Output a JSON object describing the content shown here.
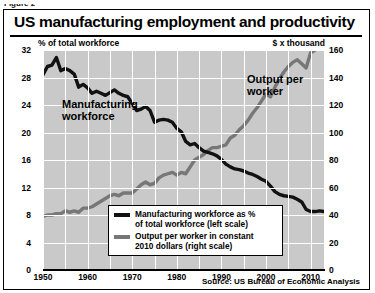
{
  "figure_label": "Figure 2",
  "title": "US manufacturing employment and productivity",
  "axis_note_left": "% of total workforce",
  "axis_note_right": "$ x thousand",
  "source": "Source: US Bureau of Economic Analysis",
  "labels": {
    "manufacturing": "Manufacturing\nworkforce",
    "output": "Output per\nworker"
  },
  "legend": {
    "items": [
      {
        "text": "Manufacturing workforce as %\nof total workforce (left scale)",
        "color": "#111111"
      },
      {
        "text": "Output per worker in constant\n2010 dollars (right scale)",
        "color": "#777777"
      }
    ]
  },
  "colors": {
    "plot_background": "#c9c9c9",
    "gridline": "#ffffff",
    "manufacturing_line": "#111111",
    "output_line": "#777777",
    "frame": "#000000"
  },
  "chart_data": {
    "type": "line",
    "title": "US manufacturing employment and productivity",
    "subtitle": "",
    "xlabel": "",
    "ylabel": "% of total workforce",
    "y2label": "$ x thousand",
    "xlim": [
      1950,
      2013
    ],
    "ylim": [
      0,
      32
    ],
    "y2lim": [
      0,
      160
    ],
    "yticks": [
      0,
      4,
      8,
      12,
      16,
      20,
      24,
      28,
      32
    ],
    "y2ticks": [
      0,
      20,
      40,
      60,
      80,
      100,
      120,
      140,
      160
    ],
    "xticks": [
      1950,
      1960,
      1970,
      1980,
      1990,
      2000,
      2010
    ],
    "grid": true,
    "grid_x_step": 5,
    "legend_position": "inside-bottom-center",
    "annotations": [
      {
        "text": "Manufacturing workforce",
        "x": 1957,
        "y": 22
      },
      {
        "text": "Output per worker",
        "x": 2000,
        "y": 28
      }
    ],
    "series": [
      {
        "name": "Manufacturing workforce as % of total workforce (left scale)",
        "axis": "left",
        "units": "% of total workforce",
        "color": "#111111",
        "x": [
          1950,
          1951,
          1952,
          1953,
          1954,
          1955,
          1956,
          1957,
          1958,
          1959,
          1960,
          1961,
          1962,
          1963,
          1964,
          1965,
          1966,
          1967,
          1968,
          1969,
          1970,
          1971,
          1972,
          1973,
          1974,
          1975,
          1976,
          1977,
          1978,
          1979,
          1980,
          1981,
          1982,
          1983,
          1984,
          1985,
          1986,
          1987,
          1988,
          1989,
          1990,
          1991,
          1992,
          1993,
          1994,
          1995,
          1996,
          1997,
          1998,
          1999,
          2000,
          2001,
          2002,
          2003,
          2004,
          2005,
          2006,
          2007,
          2008,
          2009,
          2010,
          2011,
          2012,
          2013
        ],
        "y": [
          28.4,
          29.6,
          29.8,
          30.9,
          29.0,
          29.3,
          29.0,
          28.5,
          26.6,
          27.0,
          26.5,
          25.7,
          26.0,
          25.7,
          25.4,
          25.8,
          26.2,
          25.7,
          25.4,
          25.2,
          24.2,
          23.2,
          23.4,
          23.8,
          23.2,
          21.5,
          21.8,
          21.9,
          21.8,
          21.5,
          20.6,
          20.1,
          18.7,
          18.2,
          18.4,
          17.8,
          17.3,
          17.1,
          16.9,
          16.6,
          16.1,
          15.4,
          15.0,
          14.7,
          14.6,
          14.4,
          14.1,
          13.9,
          13.6,
          13.2,
          12.9,
          12.2,
          11.4,
          11.0,
          10.8,
          10.7,
          10.6,
          10.3,
          9.9,
          8.8,
          8.5,
          8.5,
          8.6,
          8.5
        ]
      },
      {
        "name": "Output per worker in constant 2010 dollars (right scale)",
        "axis": "right",
        "units": "$ x thousand",
        "color": "#777777",
        "x": [
          1950,
          1951,
          1952,
          1953,
          1954,
          1955,
          1956,
          1957,
          1958,
          1959,
          1960,
          1961,
          1962,
          1963,
          1964,
          1965,
          1966,
          1967,
          1968,
          1969,
          1970,
          1971,
          1972,
          1973,
          1974,
          1975,
          1976,
          1977,
          1978,
          1979,
          1980,
          1981,
          1982,
          1983,
          1984,
          1985,
          1986,
          1987,
          1988,
          1989,
          1990,
          1991,
          1992,
          1993,
          1994,
          1995,
          1996,
          1997,
          1998,
          1999,
          2000,
          2001,
          2002,
          2003,
          2004,
          2005,
          2006,
          2007,
          2008,
          2009,
          2010,
          2011,
          2012,
          2013
        ],
        "y": [
          39,
          40,
          40,
          41,
          41,
          43,
          42,
          43,
          42,
          45,
          45,
          46,
          48,
          50,
          52,
          54,
          55,
          54,
          56,
          56,
          56,
          59,
          62,
          64,
          62,
          63,
          67,
          69,
          70,
          71,
          69,
          71,
          70,
          75,
          80,
          82,
          84,
          87,
          89,
          89,
          90,
          91,
          96,
          98,
          102,
          105,
          109,
          114,
          118,
          123,
          128,
          126,
          133,
          139,
          144,
          148,
          151,
          153,
          150,
          147,
          158,
          160,
          161,
          162
        ]
      }
    ]
  }
}
